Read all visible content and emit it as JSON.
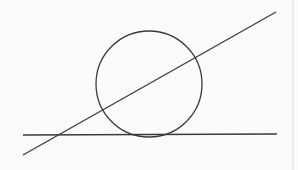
{
  "diagram": {
    "stroke_color": "#3a3a3a",
    "background": "#fbfbfb",
    "border_color": "#dddddd",
    "circle": {
      "cx": 149,
      "cy": 84,
      "r": 53
    },
    "tangent_line": {
      "x1": 23,
      "y1": 135,
      "x2": 277,
      "y2": 134
    },
    "secant_line": {
      "x1": 23,
      "y1": 155,
      "x2": 276,
      "y2": 12
    },
    "right_border_x": 293
  }
}
